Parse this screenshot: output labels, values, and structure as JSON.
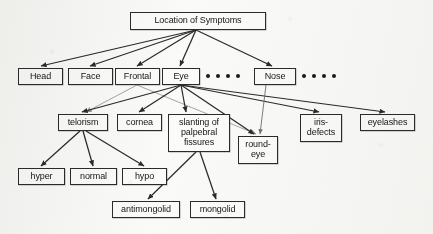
{
  "figure": {
    "background_color": "#fbfbfa",
    "line_color": "#2b2b2b",
    "faint_line_color": "#9a9a9a",
    "text_color": "#161616"
  },
  "nodes": {
    "root": {
      "label": "Location of Symptoms",
      "x": 130,
      "y": 12,
      "w": 136,
      "h": 18
    },
    "head": {
      "label": "Head",
      "x": 18,
      "y": 68,
      "w": 45,
      "h": 17
    },
    "face": {
      "label": "Face",
      "x": 68,
      "y": 68,
      "w": 45,
      "h": 17
    },
    "frontal": {
      "label": "Frontal",
      "x": 115,
      "y": 68,
      "w": 45,
      "h": 17
    },
    "eye": {
      "label": "Eye",
      "x": 162,
      "y": 68,
      "w": 38,
      "h": 17
    },
    "nose": {
      "label": "Nose",
      "x": 254,
      "y": 68,
      "w": 42,
      "h": 17
    },
    "telorism": {
      "label": "telorism",
      "x": 58,
      "y": 114,
      "w": 50,
      "h": 17
    },
    "cornea": {
      "label": "cornea",
      "x": 117,
      "y": 114,
      "w": 45,
      "h": 17
    },
    "slanting": {
      "label": "slanting of palpebral fissures",
      "x": 168,
      "y": 114,
      "w": 62,
      "h": 38
    },
    "roundeye": {
      "label": "round- eye",
      "x": 238,
      "y": 136,
      "w": 40,
      "h": 28
    },
    "irisdefects": {
      "label": "iris- defects",
      "x": 300,
      "y": 114,
      "w": 42,
      "h": 28
    },
    "eyelashes": {
      "label": "eyelashes",
      "x": 360,
      "y": 114,
      "w": 55,
      "h": 17
    },
    "hyper": {
      "label": "hyper",
      "x": 18,
      "y": 168,
      "w": 47,
      "h": 17
    },
    "normal": {
      "label": "normal",
      "x": 70,
      "y": 168,
      "w": 47,
      "h": 17
    },
    "hypo": {
      "label": "hypo",
      "x": 122,
      "y": 168,
      "w": 45,
      "h": 17
    },
    "antimongolid": {
      "label": "antimongolid",
      "x": 112,
      "y": 201,
      "w": 68,
      "h": 17
    },
    "mongolid": {
      "label": "mongolid",
      "x": 190,
      "y": 201,
      "w": 55,
      "h": 17
    }
  },
  "ellipses": {
    "after_eye": {
      "count": 4,
      "x": 206,
      "y": 74
    },
    "after_nose": {
      "count": 4,
      "x": 302,
      "y": 74
    }
  },
  "edges": [
    {
      "from": "root",
      "to": "head",
      "x1": 196,
      "y1": 30,
      "x2": 41,
      "y2": 66,
      "weight": "bold"
    },
    {
      "from": "root",
      "to": "face",
      "x1": 196,
      "y1": 30,
      "x2": 90,
      "y2": 66,
      "weight": "bold"
    },
    {
      "from": "root",
      "to": "frontal",
      "x1": 196,
      "y1": 30,
      "x2": 137,
      "y2": 66,
      "weight": "bold"
    },
    {
      "from": "root",
      "to": "eye",
      "x1": 196,
      "y1": 30,
      "x2": 180,
      "y2": 66,
      "weight": "bold"
    },
    {
      "from": "root",
      "to": "nose",
      "x1": 196,
      "y1": 30,
      "x2": 272,
      "y2": 66,
      "weight": "bold"
    },
    {
      "from": "frontal",
      "to": "telorism",
      "x1": 137,
      "y1": 85,
      "x2": 86,
      "y2": 112,
      "weight": "faint"
    },
    {
      "from": "frontal",
      "to": "roundeye",
      "x1": 137,
      "y1": 85,
      "x2": 256,
      "y2": 134,
      "weight": "faint"
    },
    {
      "from": "eye",
      "to": "telorism",
      "x1": 181,
      "y1": 85,
      "x2": 82,
      "y2": 112,
      "weight": "bold"
    },
    {
      "from": "eye",
      "to": "cornea",
      "x1": 181,
      "y1": 85,
      "x2": 139,
      "y2": 112,
      "weight": "bold"
    },
    {
      "from": "eye",
      "to": "slanting",
      "x1": 181,
      "y1": 85,
      "x2": 186,
      "y2": 112,
      "weight": "bold"
    },
    {
      "from": "eye",
      "to": "roundeye",
      "x1": 181,
      "y1": 85,
      "x2": 254,
      "y2": 134,
      "weight": "bold"
    },
    {
      "from": "eye",
      "to": "irisdefects",
      "x1": 181,
      "y1": 85,
      "x2": 319,
      "y2": 112,
      "weight": "bold"
    },
    {
      "from": "eye",
      "to": "eyelashes",
      "x1": 181,
      "y1": 85,
      "x2": 385,
      "y2": 112,
      "weight": "bold"
    },
    {
      "from": "nose",
      "to": "roundeye",
      "x1": 266,
      "y1": 85,
      "x2": 260,
      "y2": 134,
      "weight": "thin"
    },
    {
      "from": "telorism",
      "to": "hyper",
      "x1": 80,
      "y1": 131,
      "x2": 41,
      "y2": 166,
      "weight": "bold"
    },
    {
      "from": "telorism",
      "to": "normal",
      "x1": 83,
      "y1": 131,
      "x2": 93,
      "y2": 166,
      "weight": "bold"
    },
    {
      "from": "telorism",
      "to": "hypo",
      "x1": 86,
      "y1": 131,
      "x2": 144,
      "y2": 166,
      "weight": "bold"
    },
    {
      "from": "slanting",
      "to": "antimongolid",
      "x1": 196,
      "y1": 152,
      "x2": 148,
      "y2": 199,
      "weight": "bold"
    },
    {
      "from": "slanting",
      "to": "mongolid",
      "x1": 200,
      "y1": 152,
      "x2": 216,
      "y2": 199,
      "weight": "bold"
    }
  ]
}
